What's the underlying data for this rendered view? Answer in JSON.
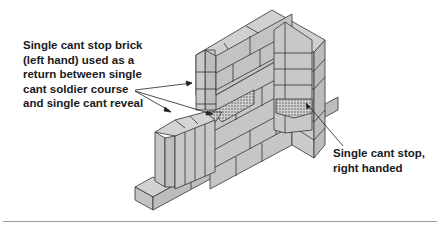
{
  "diagram": {
    "colors": {
      "brick_face": "#c8c8c8",
      "brick_light": "#d4d4d4",
      "brick_dark": "#b8b8b8",
      "outline": "#333333",
      "hatch": "#a8a8a8",
      "rule": "#9a9a9a"
    },
    "annotations": [
      {
        "id": "left",
        "lines": [
          "Single cant stop brick",
          "(left hand) used as a",
          "return between single",
          "cant soldier course",
          "and single cant reveal"
        ]
      },
      {
        "id": "right",
        "lines": [
          "Single cant stop,",
          "right handed"
        ]
      }
    ]
  }
}
